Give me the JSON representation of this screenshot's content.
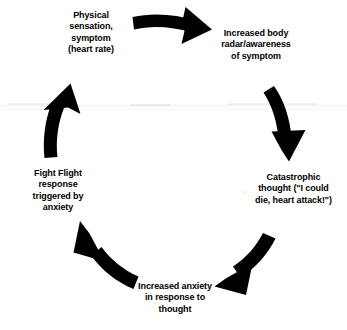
{
  "diagram": {
    "type": "cycle",
    "direction": "clockwise",
    "ink_color": "#000000",
    "background_color": "#ffffff",
    "nodes": [
      {
        "id": "physical-sensation",
        "position": "top-left",
        "text": "Physical\nsensation,\nsymptom\n(heart rate)"
      },
      {
        "id": "body-radar",
        "position": "top-right",
        "text": "Increased body\nradar/awareness\nof symptom"
      },
      {
        "id": "catastrophic-thought",
        "position": "right",
        "text": "Catastrophic\nthought (\"I could\ndie, heart attack!\")"
      },
      {
        "id": "increased-anxiety",
        "position": "bottom",
        "text": "Increased anxiety\nin response to\nthought"
      },
      {
        "id": "fight-flight",
        "position": "left",
        "text": "Fight Flight\nresponse\ntriggered by\nanxiety"
      }
    ],
    "arrows": [
      {
        "id": "arrow-top",
        "from": "physical-sensation",
        "to": "body-radar",
        "points": "right"
      },
      {
        "id": "arrow-right",
        "from": "body-radar",
        "to": "catastrophic-thought",
        "points": "down"
      },
      {
        "id": "arrow-bottom-right",
        "from": "catastrophic-thought",
        "to": "increased-anxiety",
        "points": "down-left"
      },
      {
        "id": "arrow-bottom-left",
        "from": "increased-anxiety",
        "to": "fight-flight",
        "points": "up-left"
      },
      {
        "id": "arrow-left",
        "from": "fight-flight",
        "to": "physical-sensation",
        "points": "up"
      }
    ]
  }
}
